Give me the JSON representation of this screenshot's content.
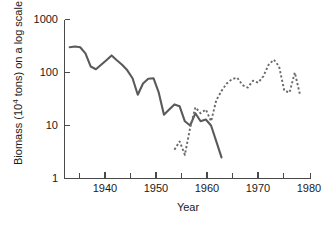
{
  "chart_data": {
    "type": "line",
    "title": "",
    "xlabel": "Year",
    "ylabel_main": "Biomass (10",
    "ylabel_sup": "4",
    "ylabel_tail": " tons) on a log scale",
    "ylabel_full": "Biomass (10^4 tons) on a log scale",
    "yscale": "log",
    "xlim": [
      1933,
      1980
    ],
    "ylim": [
      1,
      1000
    ],
    "grid": false,
    "legend": "none",
    "xticks_major": [
      1940,
      1950,
      1960,
      1970,
      1980
    ],
    "xticks_major_labels": [
      "1940",
      "1950",
      "1960",
      "1970",
      "1980"
    ],
    "xticks_minor": [
      1935,
      1945,
      1955,
      1965,
      1975
    ],
    "yticks": [
      1,
      10,
      100,
      1000
    ],
    "ytick_labels": [
      "1",
      "10",
      "100",
      "1000"
    ],
    "series": [
      {
        "name": "historic-biomass-solid",
        "style": "solid",
        "color": "#5a5a5a",
        "x": [
          1934,
          1935,
          1936,
          1937,
          1938,
          1939,
          1940,
          1941,
          1942,
          1943,
          1944,
          1945,
          1946,
          1947,
          1948,
          1949,
          1950,
          1951,
          1952,
          1953,
          1954,
          1955,
          1956,
          1957,
          1958,
          1959,
          1960,
          1961,
          1962,
          1963
        ],
        "values": [
          300,
          310,
          300,
          230,
          130,
          115,
          140,
          170,
          210,
          170,
          140,
          110,
          78,
          38,
          62,
          76,
          78,
          42,
          16,
          20,
          25,
          23,
          12,
          10,
          17,
          12,
          13,
          10,
          5.0,
          2.5
        ]
      },
      {
        "name": "recovery-biomass-dashed",
        "style": "dashed",
        "color": "#6a6a6a",
        "x": [
          1954,
          1955,
          1956,
          1957,
          1958,
          1959,
          1960,
          1961,
          1962,
          1963,
          1964,
          1965,
          1966,
          1967,
          1968,
          1969,
          1970,
          1971,
          1972,
          1973,
          1974,
          1975,
          1976,
          1977,
          1978
        ],
        "values": [
          3.5,
          5.0,
          2.8,
          9.0,
          22,
          17,
          20,
          12,
          30,
          45,
          62,
          75,
          80,
          58,
          52,
          70,
          64,
          85,
          140,
          175,
          130,
          45,
          42,
          100,
          38
        ]
      }
    ]
  },
  "axis": {
    "x_title": "Year",
    "y_title_pre": "Biomass (10",
    "y_title_sup": "4",
    "y_title_post": " tons) on a log scale"
  }
}
